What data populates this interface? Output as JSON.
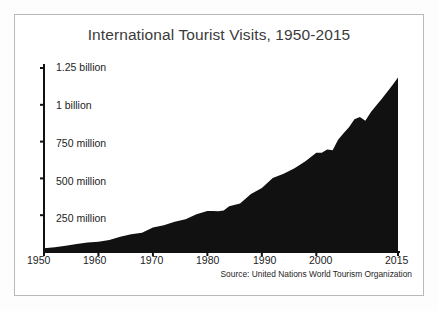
{
  "figure": {
    "title": "International Tourist Visits, 1950-2015",
    "source_note": "Source: United Nations World Tourism Organization",
    "frame_color": "#b9b9b9",
    "area_color": "#111111",
    "axis_color": "#111111",
    "background_color": "#ffffff"
  },
  "axes": {
    "y_tick_labels": [
      "1.25 billion",
      "1 billion",
      "750 million",
      "500 million",
      "250 million"
    ],
    "x_tick_labels": [
      "1950",
      "1960",
      "1970",
      "1980",
      "1990",
      "2000",
      "2015"
    ]
  },
  "chart_data": {
    "type": "area",
    "title": "International Tourist Visits, 1950-2015",
    "subtitle": "",
    "xlabel": "",
    "ylabel": "",
    "annotations": [
      "Source: United Nations World Tourism Organization"
    ],
    "legend": [],
    "legend_position": "none",
    "grid": false,
    "xlim": [
      1950,
      2015
    ],
    "ylim": [
      0,
      1250000000
    ],
    "yticks": [
      250000000,
      500000000,
      750000000,
      1000000000,
      1250000000
    ],
    "ytick_labels": [
      "250 million",
      "500 million",
      "750 million",
      "1 billion",
      "1.25 billion"
    ],
    "xticks": [
      1950,
      1960,
      1970,
      1980,
      1990,
      2000,
      2015
    ],
    "xtick_labels": [
      "1950",
      "1960",
      "1970",
      "1980",
      "1990",
      "2000",
      "2015"
    ],
    "series": [
      {
        "name": "International tourist arrivals",
        "x": [
          1950,
          1952,
          1954,
          1956,
          1958,
          1960,
          1962,
          1964,
          1966,
          1968,
          1970,
          1972,
          1974,
          1976,
          1978,
          1980,
          1981,
          1982,
          1983,
          1984,
          1986,
          1988,
          1990,
          1992,
          1994,
          1996,
          1998,
          2000,
          2001,
          2002,
          2003,
          2004,
          2005,
          2006,
          2007,
          2008,
          2009,
          2010,
          2011,
          2012,
          2013,
          2014,
          2015
        ],
        "values": [
          25000000,
          33000000,
          43000000,
          55000000,
          64000000,
          69000000,
          81000000,
          104000000,
          120000000,
          131000000,
          166000000,
          182000000,
          206000000,
          222000000,
          257000000,
          278000000,
          278000000,
          277000000,
          282000000,
          310000000,
          330000000,
          394000000,
          435000000,
          503000000,
          531000000,
          569000000,
          616000000,
          674000000,
          675000000,
          696000000,
          691000000,
          762000000,
          806000000,
          847000000,
          901000000,
          917000000,
          892000000,
          950000000,
          995000000,
          1039000000,
          1087000000,
          1134000000,
          1186000000
        ]
      }
    ]
  }
}
